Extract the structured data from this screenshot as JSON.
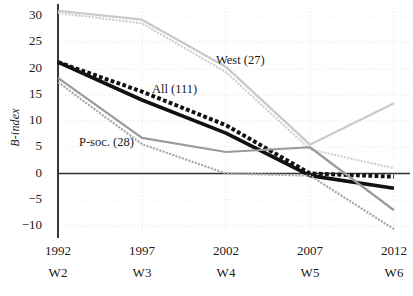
{
  "chart_data": {
    "type": "line",
    "title": "",
    "xlabel": "",
    "ylabel": "B-index",
    "ylim": [
      -12,
      32
    ],
    "yticks": [
      30,
      25,
      20,
      15,
      10,
      5,
      0,
      -5,
      -10
    ],
    "ytick_labels": [
      "30",
      "25",
      "20",
      "15",
      "10",
      "5",
      "0",
      "−5",
      "−10"
    ],
    "x": [
      "1992",
      "1997",
      "2002",
      "2007",
      "2012"
    ],
    "x_secondary": [
      "W2",
      "W3",
      "W4",
      "W5",
      "W6"
    ],
    "grid": true,
    "legend": "inline-annotations",
    "zero_line": true,
    "series": [
      {
        "name": "West (27)",
        "style": "solid",
        "color": "#c9c9c9",
        "width": 2.2,
        "values": [
          31.0,
          29.3,
          20.3,
          5.5,
          13.4
        ]
      },
      {
        "name": "West (27) dotted",
        "style": "dotted",
        "color": "#cfcfcf",
        "width": 2.2,
        "values": [
          30.6,
          28.6,
          19.3,
          4.6,
          1.0
        ]
      },
      {
        "name": "All (111)",
        "style": "dotted",
        "color": "#111111",
        "width": 4.0,
        "values": [
          21.2,
          15.6,
          9.2,
          0.0,
          -0.6
        ]
      },
      {
        "name": "All (111) solid",
        "style": "solid",
        "color": "#111111",
        "width": 3.6,
        "values": [
          21.2,
          14.0,
          7.7,
          -0.4,
          -2.8
        ]
      },
      {
        "name": "P-soc. (28)",
        "style": "solid",
        "color": "#9a9a9a",
        "width": 2.2,
        "values": [
          18.2,
          6.8,
          4.1,
          5.0,
          -7.0
        ]
      },
      {
        "name": "P-soc. (28) dotted",
        "style": "dotted",
        "color": "#a8a8a8",
        "width": 2.2,
        "values": [
          17.4,
          5.6,
          0.0,
          -0.4,
          -10.6
        ]
      }
    ],
    "annotations": [
      {
        "text": "West (27)",
        "x_px": 216,
        "y_px": 61
      },
      {
        "text": "All (111)",
        "x_px": 152,
        "y_px": 90
      },
      {
        "text": "P-soc. (28)",
        "x_px": 79,
        "y_px": 143
      }
    ]
  },
  "axes": {
    "y_label_html": "B-index",
    "y_ticks": [
      {
        "label": "30",
        "y_px": 16
      },
      {
        "label": "25",
        "y_px": 42
      },
      {
        "label": "20",
        "y_px": 69
      },
      {
        "label": "15",
        "y_px": 95
      },
      {
        "label": "10",
        "y_px": 121
      },
      {
        "label": "5",
        "y_px": 147
      },
      {
        "label": "0",
        "y_px": 174
      },
      {
        "label": "−5",
        "y_px": 200
      },
      {
        "label": "−10",
        "y_px": 226
      }
    ],
    "x_ticks": [
      {
        "year": "1992",
        "wave": "W2",
        "x_px": 58
      },
      {
        "year": "1997",
        "wave": "W3",
        "x_px": 142
      },
      {
        "year": "2002",
        "wave": "W4",
        "x_px": 226
      },
      {
        "year": "2007",
        "wave": "W5",
        "x_px": 310
      },
      {
        "year": "2012",
        "wave": "W6",
        "x_px": 394
      }
    ]
  }
}
